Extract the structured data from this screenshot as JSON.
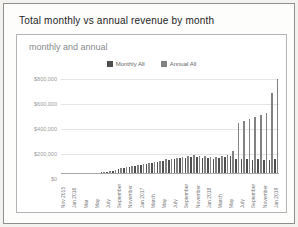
{
  "window": {
    "title": "Total monthly vs annual revenue by month"
  },
  "chart": {
    "subtitle": "monthly and annual",
    "colors": {
      "monthly_bar": "#4f4f4f",
      "annual_bar": "#828282",
      "gridline": "#e4e4e4",
      "axis_text": "#9a9a9a"
    }
  },
  "chart_data": {
    "type": "bar",
    "title": "Total monthly vs annual revenue by month",
    "subtitle": "monthly and annual",
    "ylabel": "",
    "xlabel": "",
    "ylim": [
      0,
      800000
    ],
    "y_ticks": [
      0,
      200000,
      400000,
      600000,
      800000
    ],
    "y_tick_labels": [
      "$800,000",
      "$600,000",
      "$400,000",
      "$200,000",
      "$0"
    ],
    "grid": true,
    "legend_position": "top-center",
    "categories": [
      "Nov 2015",
      "Dec 2015",
      "Jan 2016",
      "Feb 2016",
      "Mar 2016",
      "Apr 2016",
      "May 2016",
      "Jun 2016",
      "Jul 2016",
      "Aug 2016",
      "Sep 2016",
      "Oct 2016",
      "Nov 2016",
      "Dec 2016",
      "Jan 2017",
      "Feb 2017",
      "Mar 2017",
      "Apr 2017",
      "May 2017",
      "Jun 2017",
      "Jul 2017",
      "Aug 2017",
      "Sep 2017",
      "Oct 2017",
      "Nov 2017",
      "Dec 2017",
      "Jan 2018",
      "Feb 2018",
      "Mar 2018",
      "Apr 2018",
      "May 2018",
      "Jun 2018",
      "Jul 2018",
      "Aug 2018",
      "Sep 2018",
      "Oct 2018",
      "Nov 2018",
      "Dec 2018",
      "Jan 2019"
    ],
    "x_tick_labels": [
      "Nov 2015",
      "",
      "Jan 2016",
      "",
      "Mar",
      "",
      "May",
      "",
      "July",
      "",
      "September",
      "",
      "November",
      "",
      "Jan 2017",
      "",
      "March",
      "",
      "May",
      "",
      "July",
      "",
      "September",
      "",
      "November",
      "",
      "Jan 2018",
      "",
      "March",
      "",
      "May",
      "",
      "July",
      "",
      "September",
      "",
      "November",
      "",
      "Jan 2019"
    ],
    "series": [
      {
        "name": "Monthly All",
        "color": "#4f4f4f",
        "values": [
          1000,
          1500,
          2000,
          2500,
          4000,
          5000,
          8000,
          11000,
          16000,
          24000,
          36000,
          46000,
          54000,
          62000,
          72000,
          80000,
          90000,
          98000,
          106000,
          112000,
          118000,
          124000,
          130000,
          136000,
          132000,
          128000,
          126000,
          122000,
          126000,
          132000,
          140000,
          120000,
          115000,
          118000,
          112000,
          116000,
          110000,
          114000,
          118000
        ]
      },
      {
        "name": "Annual All",
        "color": "#828282",
        "values": [
          1200,
          1800,
          2600,
          3200,
          5200,
          6800,
          10000,
          14000,
          20000,
          29000,
          43000,
          53000,
          61000,
          70000,
          80000,
          88000,
          98000,
          106000,
          115000,
          121000,
          127000,
          133000,
          141000,
          147000,
          143000,
          139000,
          137000,
          133000,
          139000,
          152000,
          185000,
          410000,
          425000,
          440000,
          455000,
          470000,
          490000,
          650000,
          755000
        ]
      }
    ]
  }
}
